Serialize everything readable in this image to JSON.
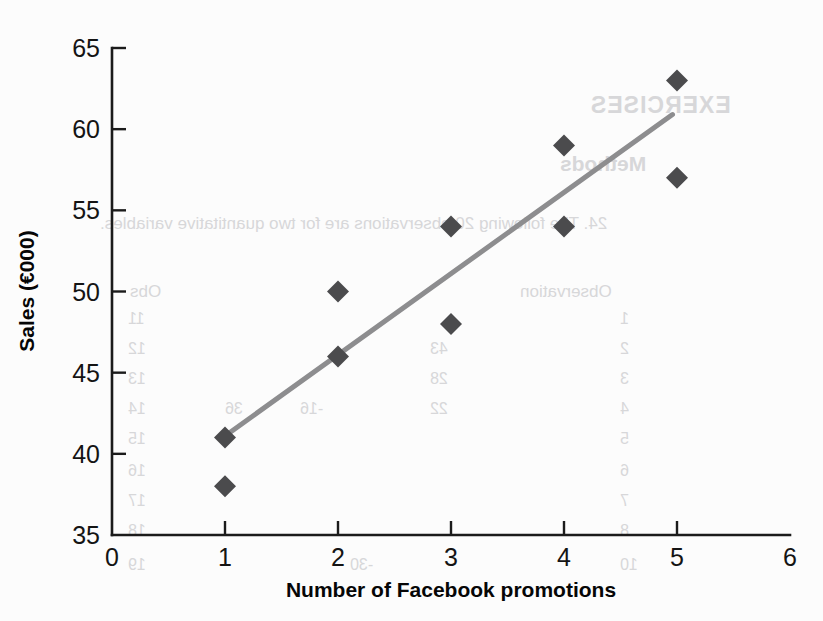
{
  "page": {
    "width": 823,
    "height": 621,
    "background_color": "#fcfcfc"
  },
  "colors": {
    "marker": "#4b4b4d",
    "trendline": "#8d8d8f",
    "axis": "#1b1b1b",
    "text": "#141414",
    "bleed_text": "#d7d7d9"
  },
  "chart_data": {
    "type": "scatter",
    "title": "",
    "xlabel": "Number of Facebook promotions",
    "ylabel": "Sales (€000)",
    "xlim": [
      0,
      6
    ],
    "ylim": [
      35,
      65
    ],
    "xticks": [
      "0",
      "1",
      "2",
      "3",
      "4",
      "5",
      "6"
    ],
    "yticks": [
      "35",
      "40",
      "45",
      "50",
      "55",
      "60",
      "65"
    ],
    "xtick_values": [
      0,
      1,
      2,
      3,
      4,
      5,
      6
    ],
    "ytick_values": [
      35,
      40,
      45,
      50,
      55,
      60,
      65
    ],
    "grid": false,
    "legend": null,
    "x": [
      1,
      1,
      2,
      2,
      3,
      3,
      4,
      4,
      5,
      5
    ],
    "y": [
      41,
      38,
      50,
      46,
      54,
      48,
      59,
      54,
      63,
      57
    ],
    "points": [
      {
        "x": 1,
        "y": 41
      },
      {
        "x": 1,
        "y": 38
      },
      {
        "x": 2,
        "y": 50
      },
      {
        "x": 2,
        "y": 46
      },
      {
        "x": 3,
        "y": 54
      },
      {
        "x": 3,
        "y": 48
      },
      {
        "x": 4,
        "y": 59
      },
      {
        "x": 4,
        "y": 54
      },
      {
        "x": 5,
        "y": 63
      },
      {
        "x": 5,
        "y": 57
      }
    ],
    "marker_shape": "diamond",
    "trendline": {
      "type": "linear-fit",
      "x_start": 1.0,
      "y_start": 41.1,
      "x_end": 4.96,
      "y_end": 60.9
    }
  },
  "bleed_through": [
    {
      "text": "EXERCISES",
      "x": 590,
      "y": 92,
      "style": "b-head"
    },
    {
      "text": "Methods",
      "x": 560,
      "y": 152,
      "style": "b-sub"
    },
    {
      "text": "24. The following 20 observations are for two quantitative variables.",
      "x": 100,
      "y": 214,
      "style": "b-body"
    },
    {
      "text": "Observation",
      "x": 520,
      "y": 282,
      "style": "b-body"
    },
    {
      "text": "Obs",
      "x": 130,
      "y": 282,
      "style": "b-body"
    },
    {
      "text": "1",
      "x": 620,
      "y": 310,
      "style": "b-cell"
    },
    {
      "text": "11",
      "x": 128,
      "y": 310,
      "style": "b-cell"
    },
    {
      "text": "2",
      "x": 620,
      "y": 340,
      "style": "b-cell"
    },
    {
      "text": "12",
      "x": 128,
      "y": 340,
      "style": "b-cell"
    },
    {
      "text": "43",
      "x": 430,
      "y": 340,
      "style": "b-cell"
    },
    {
      "text": "3",
      "x": 620,
      "y": 370,
      "style": "b-cell"
    },
    {
      "text": "13",
      "x": 128,
      "y": 370,
      "style": "b-cell"
    },
    {
      "text": "28",
      "x": 430,
      "y": 370,
      "style": "b-cell"
    },
    {
      "text": "4",
      "x": 620,
      "y": 400,
      "style": "b-cell"
    },
    {
      "text": "14",
      "x": 128,
      "y": 400,
      "style": "b-cell"
    },
    {
      "text": "22",
      "x": 430,
      "y": 400,
      "style": "b-cell"
    },
    {
      "text": "-16",
      "x": 300,
      "y": 400,
      "style": "b-cell"
    },
    {
      "text": "36",
      "x": 225,
      "y": 400,
      "style": "b-cell"
    },
    {
      "text": "5",
      "x": 620,
      "y": 430,
      "style": "b-cell"
    },
    {
      "text": "15",
      "x": 128,
      "y": 430,
      "style": "b-cell"
    },
    {
      "text": "6",
      "x": 620,
      "y": 462,
      "style": "b-cell"
    },
    {
      "text": "16",
      "x": 128,
      "y": 462,
      "style": "b-cell"
    },
    {
      "text": "7",
      "x": 620,
      "y": 492,
      "style": "b-cell"
    },
    {
      "text": "17",
      "x": 128,
      "y": 492,
      "style": "b-cell"
    },
    {
      "text": "8",
      "x": 620,
      "y": 522,
      "style": "b-cell"
    },
    {
      "text": "18",
      "x": 128,
      "y": 522,
      "style": "b-cell"
    },
    {
      "text": "-30",
      "x": 350,
      "y": 556,
      "style": "b-cell"
    },
    {
      "text": "19",
      "x": 128,
      "y": 556,
      "style": "b-cell"
    },
    {
      "text": "10",
      "x": 620,
      "y": 556,
      "style": "b-cell"
    }
  ]
}
